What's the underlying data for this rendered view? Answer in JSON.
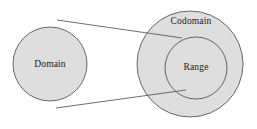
{
  "diagram": {
    "type": "set-mapping-venn",
    "background_color": "#ffffff",
    "fill_color": "#dedede",
    "stroke_color": "#585858",
    "line_color": "#4a4a4a",
    "text_color": "#1a1a1a",
    "sets": [
      {
        "id": "domain",
        "label": "Domain",
        "cx": 50,
        "cy": 64,
        "r": 37,
        "label_x": 50,
        "label_y": 65
      },
      {
        "id": "codomain",
        "label": "Codomain",
        "cx": 190,
        "cy": 64,
        "r": 53,
        "label_x": 191,
        "label_y": 22
      },
      {
        "id": "range",
        "label": "Range",
        "cx": 196,
        "cy": 68,
        "r": 31,
        "label_x": 196,
        "label_y": 68
      }
    ],
    "connectors": [
      {
        "id": "upper-connector",
        "x1": 57,
        "y1": 20,
        "x2": 182,
        "y2": 38
      },
      {
        "id": "lower-connector",
        "x1": 56,
        "y1": 108,
        "x2": 186,
        "y2": 90
      }
    ]
  }
}
